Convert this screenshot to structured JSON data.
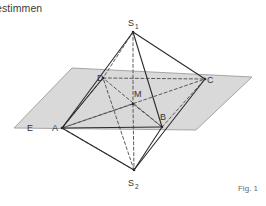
{
  "page": {
    "heading_fragment": "estimmen",
    "figure_caption": "Fig. 1"
  },
  "figure": {
    "plane_label": "E",
    "apex_top_label": "S",
    "apex_top_sub": "1",
    "apex_bottom_label": "S",
    "apex_bottom_sub": "2",
    "center_label": "M",
    "base_vertices": [
      "A",
      "B",
      "C",
      "D"
    ],
    "vertex_labels": {
      "a": "A",
      "b": "B",
      "c": "C",
      "d": "D",
      "m": "M",
      "e": "E"
    },
    "colors": {
      "plane_fill": "#d9d9d9",
      "plane_stroke": "#9a9a9a",
      "line_solid": "#2b2b2b",
      "line_dashed": "#4a4a4a",
      "label_text": "#333333",
      "background": "#ffffff"
    },
    "geometry": {
      "plane_corners": [
        [
          14,
          128
        ],
        [
          72,
          68
        ],
        [
          252,
          77
        ],
        [
          196,
          130
        ]
      ],
      "A": [
        62,
        128
      ],
      "B": [
        162,
        127
      ],
      "C": [
        205,
        79
      ],
      "D": [
        103,
        78
      ],
      "M": [
        133,
        104
      ],
      "S1": [
        133,
        32
      ],
      "S2": [
        134,
        170
      ]
    }
  }
}
